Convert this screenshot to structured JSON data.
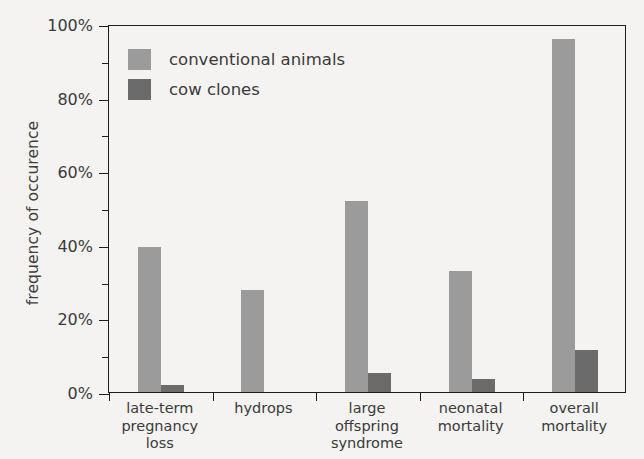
{
  "chart_data": {
    "type": "bar",
    "title": "",
    "subtitle": "",
    "xlabel": "",
    "ylabel": "frequency of occurence",
    "categories": [
      "late-term\npregnancy loss",
      "hydrops",
      "large offspring\nsyndrome",
      "neonatal\nmortality",
      "overall mortality"
    ],
    "series": [
      {
        "name": "conventional animals",
        "color": "#9b9b9b",
        "values": [
          39.5,
          27.7,
          52.0,
          33.0,
          96.0
        ]
      },
      {
        "name": "cow clones",
        "color": "#6b6b6b",
        "values": [
          1.8,
          0,
          5.2,
          3.5,
          11.4
        ]
      }
    ],
    "ylim": [
      0,
      100
    ],
    "y_ticks_major": [
      0,
      20,
      40,
      60,
      80,
      100
    ],
    "y_tick_labels": [
      "0%",
      "20%",
      "40%",
      "60%",
      "80%",
      "100%"
    ],
    "y_ticks_minor": [
      10,
      30,
      50,
      70,
      90
    ],
    "grid": false,
    "legend_position": "top-left",
    "background_color": "#f4f3f1",
    "axis_color": "#1d1d1d"
  }
}
